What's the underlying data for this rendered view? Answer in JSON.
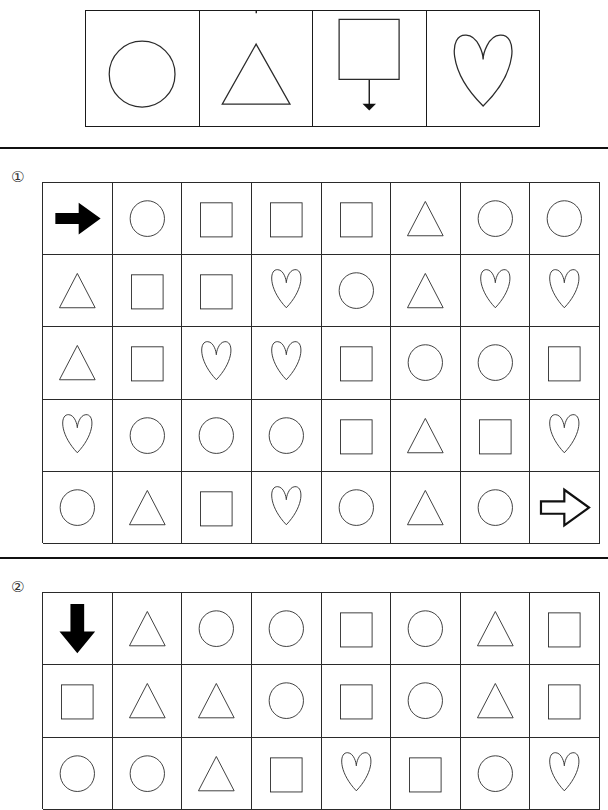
{
  "legend": {
    "name": "shape-direction-legend",
    "cells": [
      {
        "shape": "circle",
        "arrow": "right",
        "arrow_position": "top",
        "arrow_label": "arrow-right-icon"
      },
      {
        "shape": "triangle",
        "arrow": "up",
        "arrow_position": "top",
        "arrow_label": "arrow-up-icon"
      },
      {
        "shape": "square",
        "arrow": "down",
        "arrow_position": "bottom",
        "arrow_label": "arrow-down-icon"
      },
      {
        "shape": "heart",
        "arrow": "left",
        "arrow_position": "top",
        "arrow_label": "arrow-left-icon"
      }
    ]
  },
  "sections": [
    {
      "marker": "①",
      "marker_name": "section-marker-1",
      "columns": 8,
      "rows": 5,
      "grid": [
        [
          "arrow-right-solid",
          "circle",
          "square",
          "square",
          "square",
          "triangle",
          "circle",
          "circle"
        ],
        [
          "triangle",
          "square",
          "square",
          "heart",
          "circle",
          "triangle",
          "heart",
          "heart"
        ],
        [
          "triangle",
          "square",
          "heart",
          "heart",
          "square",
          "circle",
          "circle",
          "square"
        ],
        [
          "heart",
          "circle",
          "circle",
          "circle",
          "square",
          "triangle",
          "square",
          "heart"
        ],
        [
          "circle",
          "triangle",
          "square",
          "heart",
          "circle",
          "triangle",
          "circle",
          "arrow-right-hollow"
        ]
      ]
    },
    {
      "marker": "②",
      "marker_name": "section-marker-2",
      "columns": 8,
      "rows": 3,
      "grid": [
        [
          "arrow-down-solid",
          "triangle",
          "circle",
          "circle",
          "square",
          "circle",
          "triangle",
          "square"
        ],
        [
          "square",
          "triangle",
          "triangle",
          "circle",
          "square",
          "circle",
          "triangle",
          "square"
        ],
        [
          "circle",
          "circle",
          "triangle",
          "square",
          "heart",
          "square",
          "circle",
          "heart"
        ]
      ]
    }
  ],
  "colors": {
    "ink": "#000000",
    "shape_stroke": "#2b2b2b",
    "grid_line": "#2a2a2a",
    "rule": "#111111",
    "background": "#ffffff"
  }
}
